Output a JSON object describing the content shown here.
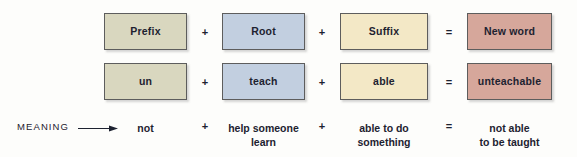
{
  "figure": {
    "background_color": "#fdfdfb",
    "text_color": "#1d2230"
  },
  "colors": {
    "prefix_box": "#d9d7bf",
    "root_box": "#c2cfe0",
    "suffix_box": "#f3e8c6",
    "newword_box": "#d6a79b",
    "border": "#5d5d5d"
  },
  "operators": {
    "plus": "+",
    "equals": "=",
    "arrow_icon": "right-arrow-icon"
  },
  "rows": {
    "header": {
      "cells": [
        {
          "label": "Prefix",
          "color_key": "prefix_box"
        },
        {
          "label": "Root",
          "color_key": "root_box"
        },
        {
          "label": "Suffix",
          "color_key": "suffix_box"
        },
        {
          "label": "New word",
          "color_key": "newword_box"
        }
      ],
      "separators": [
        "+",
        "+",
        "="
      ]
    },
    "example": {
      "cells": [
        {
          "label": "un",
          "color_key": "prefix_box"
        },
        {
          "label": "teach",
          "color_key": "root_box"
        },
        {
          "label": "able",
          "color_key": "suffix_box"
        },
        {
          "label": "unteachable",
          "color_key": "newword_box"
        }
      ],
      "separators": [
        "+",
        "+",
        "="
      ]
    },
    "meaning": {
      "label": "MEANING",
      "cells": [
        "not",
        "help someone\nlearn",
        "able to do\nsomething",
        "not able\nto be taught"
      ],
      "separators": [
        "+",
        "+",
        "="
      ]
    }
  }
}
